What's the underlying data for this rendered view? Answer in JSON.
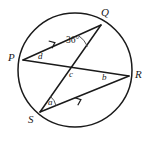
{
  "figure": {
    "stroke_color": "#1a1a1a",
    "background_color": "#ffffff",
    "circle": {
      "cx": 75,
      "cy": 70,
      "r": 57
    },
    "vertices": [
      {
        "id": "P",
        "label": "P",
        "px": 23,
        "py": 60,
        "label_x": 9,
        "label_y": 53
      },
      {
        "id": "Q",
        "label": "Q",
        "px": 101,
        "py": 25,
        "label_x": 101,
        "label_y": 9
      },
      {
        "id": "R",
        "label": "R",
        "px": 129,
        "py": 76,
        "label_x": 134,
        "label_y": 70
      },
      {
        "id": "S",
        "label": "S",
        "px": 40,
        "py": 112,
        "label_x": 29,
        "label_y": 117
      }
    ],
    "chords": [
      {
        "id": "PQ",
        "from": "P",
        "to": "Q",
        "has_arrow_marker": true
      },
      {
        "id": "PR",
        "from": "P",
        "to": "R",
        "has_arrow_marker": false
      },
      {
        "id": "QS",
        "from": "Q",
        "to": "S",
        "has_arrow_marker": false
      },
      {
        "id": "SR",
        "from": "S",
        "to": "R",
        "has_arrow_marker": true
      }
    ],
    "intersection": {
      "id": "c",
      "x": 73,
      "y": 70
    },
    "angle_labels": [
      {
        "id": "angle-q",
        "label": "36°",
        "x": 67,
        "y": 37
      },
      {
        "id": "angle-d",
        "label": "d",
        "x": 39,
        "y": 53
      },
      {
        "id": "angle-c",
        "label": "c",
        "x": 70,
        "y": 71
      },
      {
        "id": "angle-b",
        "label": "b",
        "x": 103,
        "y": 74
      },
      {
        "id": "angle-a",
        "label": "a",
        "x": 49,
        "y": 99
      }
    ],
    "arrow_markers": [
      {
        "id": "marker-pq",
        "x": 54,
        "y": 43,
        "angle": -24
      },
      {
        "id": "marker-sr",
        "x": 80,
        "y": 100,
        "angle": -24
      }
    ]
  }
}
